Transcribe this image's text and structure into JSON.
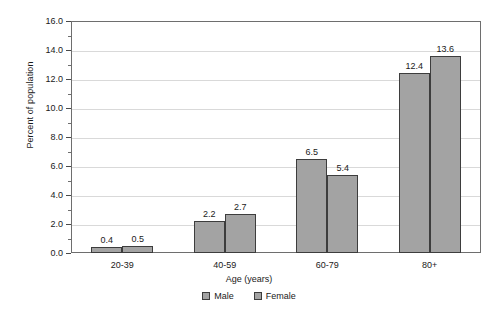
{
  "chart_data": {
    "type": "bar",
    "title": "",
    "subtitle": "",
    "xlabel": "Age (years)",
    "ylabel": "Percent of population",
    "categories": [
      "20-39",
      "40-59",
      "60-79",
      "80+"
    ],
    "series": [
      {
        "name": "Male",
        "values": [
          0.4,
          2.2,
          6.5,
          12.4
        ],
        "color": "#a3a3a3"
      },
      {
        "name": "Female",
        "values": [
          0.5,
          2.7,
          5.4,
          13.6
        ],
        "color": "#a3a3a3"
      }
    ],
    "ylim": [
      0.0,
      16.0
    ],
    "ytick_labels": [
      "0.0",
      "2.0",
      "4.0",
      "6.0",
      "8.0",
      "10.0",
      "12.0",
      "14.0",
      "16.0"
    ],
    "ytick_values": [
      0,
      2,
      4,
      6,
      8,
      10,
      12,
      14,
      16
    ],
    "yminor_values": [
      1,
      3,
      5,
      7,
      9,
      11,
      13,
      15
    ],
    "grid": true,
    "grid_color": "#d9d9d9",
    "legend_position": "bottom",
    "bar_border_color": "#3d3d3d",
    "data_labels": [
      [
        "0.4",
        "0.5"
      ],
      [
        "2.2",
        "2.7"
      ],
      [
        "6.5",
        "5.4"
      ],
      [
        "12.4",
        "13.6"
      ]
    ]
  }
}
